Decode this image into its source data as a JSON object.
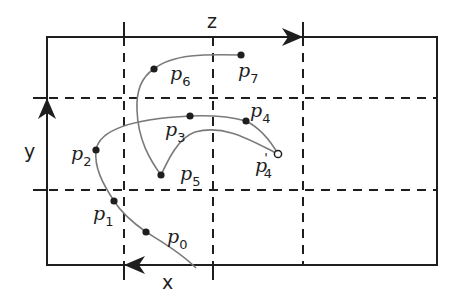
{
  "diagram": {
    "type": "grid-trajectory",
    "colors": {
      "lines": "#1e1e1e",
      "curves": "#7a7a7a",
      "background": "#ffffff"
    },
    "axes": {
      "x": {
        "label": "x",
        "direction": "left"
      },
      "y": {
        "label": "y",
        "direction": "up"
      },
      "z": {
        "label": "z",
        "direction": "right"
      }
    },
    "points": {
      "p0": {
        "base": "p",
        "sub": "0",
        "prime": ""
      },
      "p1": {
        "base": "p",
        "sub": "1",
        "prime": ""
      },
      "p2": {
        "base": "p",
        "sub": "2",
        "prime": ""
      },
      "p3": {
        "base": "p",
        "sub": "3",
        "prime": ""
      },
      "p4": {
        "base": "p",
        "sub": "4",
        "prime": ""
      },
      "p4prime": {
        "base": "p",
        "sub": "4",
        "prime": "'"
      },
      "p5": {
        "base": "p",
        "sub": "5",
        "prime": ""
      },
      "p6": {
        "base": "p",
        "sub": "6",
        "prime": ""
      },
      "p7": {
        "base": "p",
        "sub": "7",
        "prime": ""
      }
    },
    "grid": {
      "columns": 4,
      "rows": 3,
      "style": "dashed"
    }
  }
}
